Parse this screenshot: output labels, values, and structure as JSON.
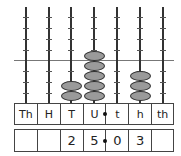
{
  "abacus": {
    "columns": [
      "Th",
      "H",
      "T",
      "U",
      "t",
      "h",
      "th"
    ],
    "bead_counts": [
      0,
      0,
      2,
      5,
      0,
      3,
      0
    ],
    "colors": {
      "bead": "#9a9a9a",
      "rod": "#333333",
      "outline": "#333333"
    }
  },
  "table": {
    "headers": [
      "Th",
      "H",
      "T",
      "U",
      "t",
      "h",
      "th"
    ],
    "digits": [
      "",
      "",
      "2",
      "5",
      "0",
      "3",
      ""
    ],
    "decimal_point_between": [
      "U",
      "t"
    ]
  }
}
